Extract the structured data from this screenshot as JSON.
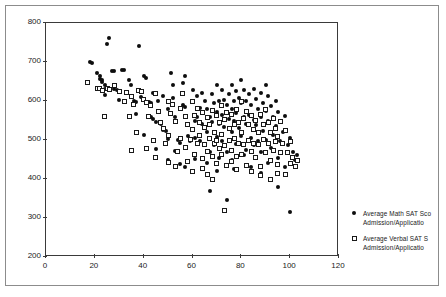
{
  "chart_data": {
    "type": "scatter",
    "title": "",
    "xlabel": "",
    "ylabel": "",
    "xlim": [
      0,
      120
    ],
    "ylim": [
      200,
      800
    ],
    "xticks": [
      0,
      20,
      40,
      60,
      80,
      100,
      120
    ],
    "yticks": [
      200,
      300,
      400,
      500,
      600,
      700,
      800
    ],
    "grid": false,
    "legend_position": "right",
    "marker_colors": {
      "math": "#0d0d0d",
      "verbal": "#ffffff",
      "verbal_edge": "#1a1a1a"
    },
    "series": [
      {
        "name": "Average Math SAT Sco",
        "name_line2": "Admission/Applicatio",
        "marker": "filled-circle",
        "points": [
          [
            18,
            700
          ],
          [
            19,
            697
          ],
          [
            21,
            672
          ],
          [
            22,
            663
          ],
          [
            22,
            657
          ],
          [
            23,
            655
          ],
          [
            23,
            648
          ],
          [
            24,
            640
          ],
          [
            24,
            632
          ],
          [
            25,
            745
          ],
          [
            26,
            762
          ],
          [
            27,
            678
          ],
          [
            28,
            677
          ],
          [
            28,
            630
          ],
          [
            29,
            628
          ],
          [
            31,
            679
          ],
          [
            32,
            680
          ],
          [
            33,
            620
          ],
          [
            34,
            655
          ],
          [
            35,
            612
          ],
          [
            36,
            600
          ],
          [
            37,
            598
          ],
          [
            37,
            566
          ],
          [
            38,
            740
          ],
          [
            39,
            610
          ],
          [
            40,
            663
          ],
          [
            41,
            660
          ],
          [
            42,
            598
          ],
          [
            43,
            596
          ],
          [
            43,
            560
          ],
          [
            44,
            620
          ],
          [
            45,
            545
          ],
          [
            46,
            600
          ],
          [
            47,
            540
          ],
          [
            48,
            525
          ],
          [
            49,
            522
          ],
          [
            50,
            580
          ],
          [
            50,
            502
          ],
          [
            51,
            672
          ],
          [
            52,
            640
          ],
          [
            52,
            608
          ],
          [
            53,
            558
          ],
          [
            54,
            500
          ],
          [
            55,
            492
          ],
          [
            56,
            646
          ],
          [
            56,
            590
          ],
          [
            57,
            665
          ],
          [
            58,
            540
          ],
          [
            58,
            510
          ],
          [
            59,
            498
          ],
          [
            60,
            628
          ],
          [
            60,
            600
          ],
          [
            61,
            548
          ],
          [
            61,
            505
          ],
          [
            62,
            612
          ],
          [
            62,
            560
          ],
          [
            63,
            582
          ],
          [
            63,
            498
          ],
          [
            64,
            620
          ],
          [
            64,
            540
          ],
          [
            65,
            600
          ],
          [
            65,
            490
          ],
          [
            66,
            580
          ],
          [
            66,
            520
          ],
          [
            67,
            560
          ],
          [
            67,
            470
          ],
          [
            68,
            618
          ],
          [
            68,
            545
          ],
          [
            69,
            595
          ],
          [
            69,
            488
          ],
          [
            70,
            640
          ],
          [
            70,
            572
          ],
          [
            70,
            508
          ],
          [
            71,
            600
          ],
          [
            71,
            540
          ],
          [
            72,
            628
          ],
          [
            72,
            565
          ],
          [
            72,
            497
          ],
          [
            73,
            603
          ],
          [
            73,
            533
          ],
          [
            74,
            590
          ],
          [
            74,
            470
          ],
          [
            75,
            618
          ],
          [
            75,
            555
          ],
          [
            75,
            500
          ],
          [
            76,
            642
          ],
          [
            76,
            580
          ],
          [
            76,
            520
          ],
          [
            77,
            600
          ],
          [
            77,
            548
          ],
          [
            78,
            625
          ],
          [
            78,
            570
          ],
          [
            78,
            490
          ],
          [
            79,
            608
          ],
          [
            79,
            532
          ],
          [
            80,
            655
          ],
          [
            80,
            596
          ],
          [
            80,
            510
          ],
          [
            81,
            628
          ],
          [
            81,
            558
          ],
          [
            82,
            600
          ],
          [
            82,
            540
          ],
          [
            82,
            475
          ],
          [
            83,
            618
          ],
          [
            83,
            565
          ],
          [
            84,
            590
          ],
          [
            84,
            505
          ],
          [
            85,
            630
          ],
          [
            85,
            552
          ],
          [
            85,
            488
          ],
          [
            86,
            605
          ],
          [
            86,
            538
          ],
          [
            87,
            580
          ],
          [
            87,
            498
          ],
          [
            88,
            620
          ],
          [
            88,
            560
          ],
          [
            88,
            468
          ],
          [
            89,
            595
          ],
          [
            89,
            522
          ],
          [
            90,
            640
          ],
          [
            90,
            575
          ],
          [
            90,
            500
          ],
          [
            91,
            612
          ],
          [
            91,
            548
          ],
          [
            92,
            588
          ],
          [
            92,
            480
          ],
          [
            93,
            560
          ],
          [
            93,
            512
          ],
          [
            94,
            600
          ],
          [
            94,
            535
          ],
          [
            95,
            572
          ],
          [
            95,
            455
          ],
          [
            96,
            545
          ],
          [
            96,
            498
          ],
          [
            97,
            520
          ],
          [
            98,
            562
          ],
          [
            98,
            430
          ],
          [
            99,
            488
          ],
          [
            100,
            505
          ],
          [
            100,
            315
          ],
          [
            101,
            470
          ],
          [
            102,
            450
          ],
          [
            103,
            462
          ],
          [
            24,
            615
          ],
          [
            30,
            602
          ],
          [
            35,
            640
          ],
          [
            44,
            555
          ],
          [
            48,
            612
          ],
          [
            53,
            472
          ],
          [
            57,
            585
          ],
          [
            61,
            452
          ],
          [
            66,
            442
          ],
          [
            71,
            455
          ],
          [
            76,
            448
          ],
          [
            81,
            462
          ],
          [
            86,
            455
          ],
          [
            91,
            440
          ],
          [
            67,
            370
          ],
          [
            74,
            345
          ],
          [
            95,
            380
          ],
          [
            57,
            432
          ],
          [
            64,
            428
          ],
          [
            70,
            420
          ],
          [
            77,
            425
          ],
          [
            84,
            432
          ],
          [
            88,
            415
          ],
          [
            50,
            448
          ],
          [
            55,
            438
          ],
          [
            45,
            478
          ],
          [
            40,
            512
          ]
        ]
      },
      {
        "name": "Average Verbal SAT S",
        "name_line2": "Admission/Applicatio",
        "marker": "open-square",
        "points": [
          [
            17,
            648
          ],
          [
            21,
            633
          ],
          [
            22,
            631
          ],
          [
            23,
            628
          ],
          [
            24,
            560
          ],
          [
            25,
            632
          ],
          [
            26,
            630
          ],
          [
            28,
            640
          ],
          [
            30,
            625
          ],
          [
            32,
            598
          ],
          [
            33,
            622
          ],
          [
            34,
            560
          ],
          [
            35,
            612
          ],
          [
            36,
            592
          ],
          [
            37,
            520
          ],
          [
            38,
            628
          ],
          [
            39,
            624
          ],
          [
            40,
            605
          ],
          [
            41,
            596
          ],
          [
            42,
            560
          ],
          [
            43,
            588
          ],
          [
            44,
            498
          ],
          [
            45,
            620
          ],
          [
            46,
            572
          ],
          [
            47,
            545
          ],
          [
            48,
            530
          ],
          [
            49,
            490
          ],
          [
            50,
            600
          ],
          [
            50,
            512
          ],
          [
            51,
            568
          ],
          [
            52,
            592
          ],
          [
            53,
            548
          ],
          [
            54,
            470
          ],
          [
            55,
            582
          ],
          [
            55,
            505
          ],
          [
            56,
            620
          ],
          [
            57,
            560
          ],
          [
            57,
            480
          ],
          [
            58,
            540
          ],
          [
            59,
            502
          ],
          [
            60,
            598
          ],
          [
            60,
            528
          ],
          [
            61,
            562
          ],
          [
            61,
            462
          ],
          [
            62,
            580
          ],
          [
            62,
            490
          ],
          [
            63,
            545
          ],
          [
            63,
            512
          ],
          [
            64,
            570
          ],
          [
            64,
            452
          ],
          [
            65,
            532
          ],
          [
            65,
            488
          ],
          [
            66,
            558
          ],
          [
            66,
            470
          ],
          [
            67,
            540
          ],
          [
            67,
            505
          ],
          [
            68,
            575
          ],
          [
            68,
            458
          ],
          [
            69,
            520
          ],
          [
            69,
            492
          ],
          [
            70,
            562
          ],
          [
            70,
            500
          ],
          [
            70,
            440
          ],
          [
            71,
            545
          ],
          [
            71,
            478
          ],
          [
            72,
            588
          ],
          [
            72,
            515
          ],
          [
            72,
            462
          ],
          [
            73,
            552
          ],
          [
            73,
            485
          ],
          [
            74,
            570
          ],
          [
            74,
            435
          ],
          [
            75,
            530
          ],
          [
            75,
            498
          ],
          [
            76,
            565
          ],
          [
            76,
            472
          ],
          [
            76,
            445
          ],
          [
            77,
            540
          ],
          [
            77,
            505
          ],
          [
            78,
            578
          ],
          [
            78,
            458
          ],
          [
            79,
            545
          ],
          [
            79,
            492
          ],
          [
            80,
            600
          ],
          [
            80,
            520
          ],
          [
            80,
            462
          ],
          [
            81,
            555
          ],
          [
            81,
            488
          ],
          [
            82,
            572
          ],
          [
            82,
            435
          ],
          [
            83,
            540
          ],
          [
            83,
            498
          ],
          [
            84,
            562
          ],
          [
            84,
            470
          ],
          [
            85,
            528
          ],
          [
            85,
            492
          ],
          [
            86,
            550
          ],
          [
            86,
            455
          ],
          [
            87,
            520
          ],
          [
            87,
            488
          ],
          [
            88,
            565
          ],
          [
            88,
            432
          ],
          [
            89,
            540
          ],
          [
            89,
            502
          ],
          [
            90,
            578
          ],
          [
            90,
            468
          ],
          [
            91,
            545
          ],
          [
            91,
            490
          ],
          [
            92,
            520
          ],
          [
            92,
            448
          ],
          [
            93,
            555
          ],
          [
            93,
            472
          ],
          [
            94,
            530
          ],
          [
            94,
            495
          ],
          [
            95,
            510
          ],
          [
            95,
            438
          ],
          [
            96,
            548
          ],
          [
            96,
            468
          ],
          [
            97,
            490
          ],
          [
            98,
            525
          ],
          [
            98,
            412
          ],
          [
            99,
            468
          ],
          [
            100,
            495
          ],
          [
            100,
            440
          ],
          [
            101,
            455
          ],
          [
            102,
            432
          ],
          [
            103,
            448
          ],
          [
            58,
            445
          ],
          [
            64,
            428
          ],
          [
            68,
            398
          ],
          [
            73,
            318
          ],
          [
            45,
            455
          ],
          [
            50,
            442
          ],
          [
            53,
            432
          ],
          [
            41,
            478
          ],
          [
            35,
            472
          ],
          [
            78,
            425
          ],
          [
            84,
            418
          ],
          [
            88,
            408
          ],
          [
            92,
            398
          ],
          [
            95,
            415
          ],
          [
            66,
            412
          ],
          [
            60,
            418
          ]
        ]
      }
    ]
  },
  "legend": {
    "entries": [
      {
        "line1": "Average Math SAT Sco",
        "line2": "Admission/Applicatio"
      },
      {
        "line1": "Average Verbal SAT S",
        "line2": "Admission/Applicatio"
      }
    ]
  },
  "axes": {
    "y_labels": [
      "800",
      "700",
      "600",
      "500",
      "400",
      "300",
      "200"
    ],
    "x_labels": [
      "0",
      "20",
      "40",
      "60",
      "80",
      "100",
      "120"
    ]
  }
}
